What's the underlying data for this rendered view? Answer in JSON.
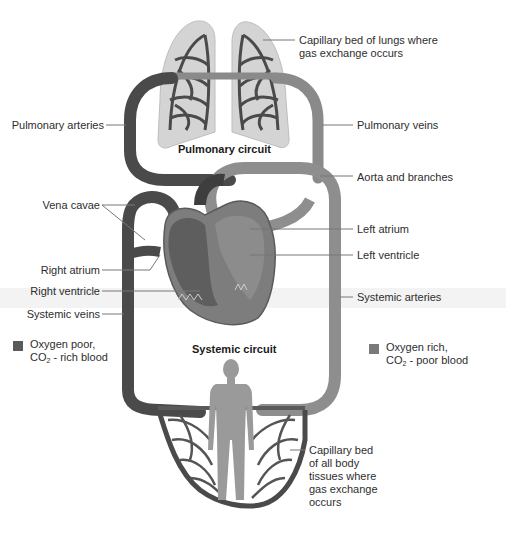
{
  "diagram": {
    "circuits": {
      "pulmonary": "Pulmonary circuit",
      "systemic": "Systemic circuit"
    },
    "labels": {
      "capillary_lungs_line1": "Capillary bed of lungs where",
      "capillary_lungs_line2": "gas exchange occurs",
      "pulmonary_arteries": "Pulmonary arteries",
      "pulmonary_veins": "Pulmonary veins",
      "aorta_and_branches": "Aorta and branches",
      "vena_cavae": "Vena cavae",
      "left_atrium": "Left atrium",
      "left_ventricle": "Left ventricle",
      "right_atrium": "Right atrium",
      "right_ventricle": "Right ventricle",
      "systemic_arteries": "Systemic arteries",
      "systemic_veins": "Systemic veins",
      "capillary_body_line1": "Capillary bed",
      "capillary_body_line2": "of all body",
      "capillary_body_line3": "tissues where",
      "capillary_body_line4": "gas exchange",
      "capillary_body_line5": "occurs"
    },
    "legend": [
      {
        "line1": "Oxygen poor,",
        "line2_prefix": "CO",
        "line2_sub": "2",
        "line2_suffix": " - rich blood",
        "color": "#5a5a5a"
      },
      {
        "line1": "Oxygen rich,",
        "line2_prefix": "CO",
        "line2_sub": "2",
        "line2_suffix": " - poor blood",
        "color": "#7a7a7a"
      }
    ],
    "colors": {
      "vessel_dark": "#4a4a4a",
      "vessel_light": "#8a8a8a",
      "lung_fill": "#cfcfcf",
      "body_silhouette": "#9a9a9a",
      "leader_line": "#777777"
    }
  }
}
